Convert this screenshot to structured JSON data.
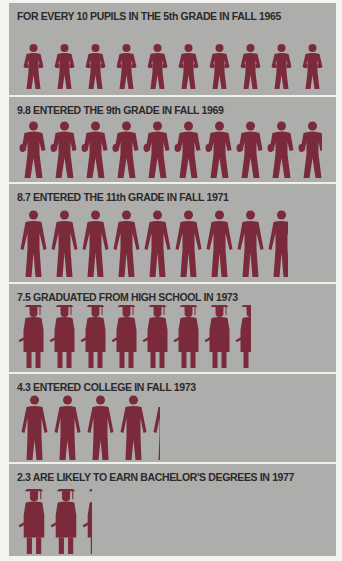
{
  "chart_data": {
    "type": "pictogram",
    "unit": "pupils (out of 10)",
    "color": "#7a2a3a",
    "background": "#adadab",
    "categories": [
      "5th grade, Fall 1965",
      "Entered 9th grade, Fall 1969",
      "Entered 11th grade, Fall 1971",
      "Graduated high school, 1973",
      "Entered college, Fall 1973",
      "Likely bachelor's degrees, 1977"
    ],
    "values": [
      10,
      9.8,
      8.7,
      7.5,
      4.3,
      2.3
    ]
  },
  "rows": [
    {
      "label": "FOR EVERY 10 PUPILS IN THE 5th GRADE IN FALL 1965",
      "value": 10,
      "icon": "child"
    },
    {
      "label": "9.8 ENTERED THE 9th GRADE IN FALL 1969",
      "value": 9.8,
      "icon": "teen"
    },
    {
      "label": "8.7 ENTERED THE 11th GRADE IN FALL 1971",
      "value": 8.7,
      "icon": "youth"
    },
    {
      "label": "7.5 GRADUATED FROM HIGH SCHOOL IN 1973",
      "value": 7.5,
      "icon": "graduate"
    },
    {
      "label": "4.3 ENTERED COLLEGE IN FALL 1973",
      "value": 4.3,
      "icon": "suit"
    },
    {
      "label": "2.3 ARE LIKELY TO EARN BACHELOR'S DEGREES IN 1977",
      "value": 2.3,
      "icon": "graduate"
    }
  ]
}
